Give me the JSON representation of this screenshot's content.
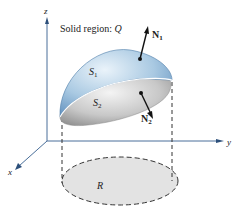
{
  "diagram": {
    "title": "Solid region: Q",
    "title_prefix": "Solid region: ",
    "title_var": "Q",
    "axes": {
      "x": "x",
      "y": "y",
      "z": "z"
    },
    "surfaces": {
      "upper": {
        "name": "S",
        "sub": "1"
      },
      "lower": {
        "name": "S",
        "sub": "2"
      }
    },
    "normals": {
      "n1": {
        "name": "N",
        "sub": "1"
      },
      "n2": {
        "name": "N",
        "sub": "2"
      }
    },
    "region": "R",
    "colors": {
      "axis": "#4a6f9a",
      "upper_surface": "#9cc0dc",
      "lower_surface": "#c9c9c9",
      "region_fill": "#e2e2e2",
      "dashed": "#333333"
    }
  }
}
